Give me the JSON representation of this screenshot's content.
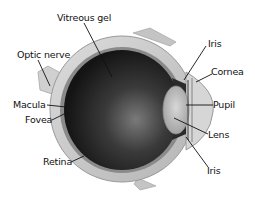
{
  "diagram": {
    "colors": {
      "vitreous_dark": "#1c1c1c",
      "vitreous_light": "#6a6a6a",
      "sclera": "#c9c9c9",
      "sclera_edge": "#9a9a9a",
      "lens": "#bdbdbd",
      "optic_nerve": "#d4d4d4",
      "leader_line": "#111111",
      "label_text": "#111111"
    },
    "labels": [
      {
        "id": "vitreous-gel",
        "text": "Vitreous gel"
      },
      {
        "id": "optic-nerve",
        "text": "Optic nerve"
      },
      {
        "id": "macula",
        "text": "Macula"
      },
      {
        "id": "fovea",
        "text": "Fovea"
      },
      {
        "id": "retina",
        "text": "Retina"
      },
      {
        "id": "iris-top",
        "text": "Iris"
      },
      {
        "id": "cornea",
        "text": "Cornea"
      },
      {
        "id": "pupil",
        "text": "Pupil"
      },
      {
        "id": "lens",
        "text": "Lens"
      },
      {
        "id": "iris-bottom",
        "text": "Iris"
      }
    ]
  }
}
